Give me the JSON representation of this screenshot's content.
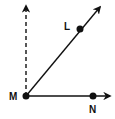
{
  "diagram": {
    "type": "angle-rays",
    "points": {
      "M": {
        "label": "M",
        "x": 26,
        "y": 96
      },
      "L": {
        "label": "L",
        "x": 80,
        "y": 29
      },
      "N": {
        "label": "N",
        "x": 93,
        "y": 96
      }
    },
    "rays": [
      {
        "from": "M",
        "through": "L",
        "style": "solid"
      },
      {
        "from": "M",
        "through": "N",
        "style": "solid"
      },
      {
        "from": "M",
        "direction": "up",
        "style": "dashed"
      }
    ],
    "colors": {
      "stroke": "#111111",
      "background": "#ffffff"
    }
  }
}
